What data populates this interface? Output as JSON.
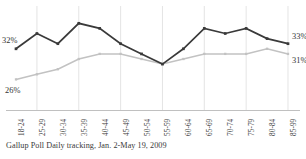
{
  "chart_data": {
    "type": "line",
    "title": "",
    "subtitle": "",
    "xlabel": "",
    "ylabel": "",
    "caption": "Gallup Poll Daily tracking, Jan. 2-May 19, 2009",
    "categories": [
      "18-24",
      "25-29",
      "30-34",
      "35-39",
      "40-44",
      "45-49",
      "50-54",
      "55-59",
      "60-64",
      "65-69",
      "70-74",
      "75-79",
      "80-84",
      "85-99"
    ],
    "ylim": [
      20,
      40
    ],
    "grid": "vertical-every-other-category",
    "legend": "none",
    "series": [
      {
        "name": "dark-series",
        "color": "#3a3a3a",
        "values": [
          32,
          35,
          33,
          37,
          36,
          33,
          31,
          29,
          32,
          36,
          35,
          36,
          34,
          33
        ],
        "start_label": "32%",
        "end_label": "33%"
      },
      {
        "name": "light-series",
        "color": "#c2c2c2",
        "values": [
          26,
          27,
          28,
          30,
          31,
          31,
          30,
          29,
          30,
          31,
          31,
          31,
          32,
          31
        ],
        "start_label": "26%",
        "end_label": "31%"
      }
    ],
    "annotations": [
      {
        "id": "left-dark",
        "text": "32%"
      },
      {
        "id": "left-light",
        "text": "26%"
      },
      {
        "id": "right-dark",
        "text": "33%"
      },
      {
        "id": "right-light",
        "text": "31%"
      }
    ]
  },
  "colors": {
    "dark_series": "#3a3a3a",
    "light_series": "#c2c2c2",
    "gridline": "#d8d8d8",
    "axis": "#b9b9b9",
    "text": "#333333",
    "background": "#ffffff"
  }
}
